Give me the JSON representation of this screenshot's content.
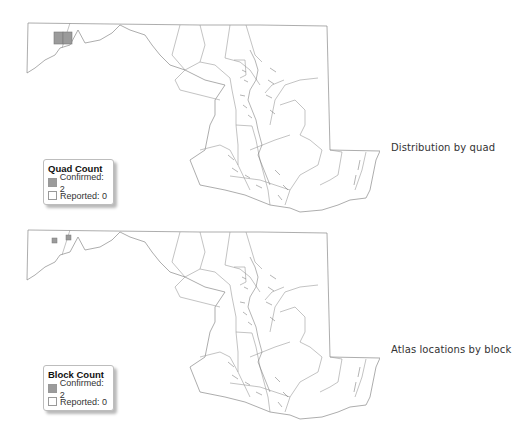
{
  "colors": {
    "confirmed": "#9b9b9b",
    "reported": "#ffffff",
    "boundary": "#9a9a9a"
  },
  "panels": [
    {
      "caption": "Distribution by quad",
      "legend": {
        "title": "Quad Count",
        "items": [
          {
            "label": "Confirmed: 2",
            "color": "#9b9b9b"
          },
          {
            "label": "Reported: 0",
            "color": "#ffffff"
          }
        ]
      }
    },
    {
      "caption": "Atlas locations by block",
      "legend": {
        "title": "Block Count",
        "items": [
          {
            "label": "Confirmed: 2",
            "color": "#9b9b9b"
          },
          {
            "label": "Reported: 0",
            "color": "#ffffff"
          }
        ]
      }
    }
  ]
}
